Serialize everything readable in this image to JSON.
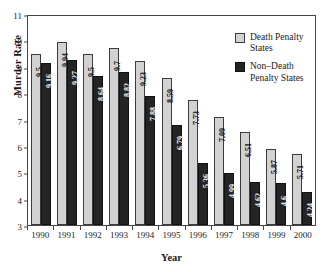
{
  "chart_data": {
    "type": "bar",
    "title": "",
    "xlabel": "Year",
    "ylabel": "Murder Rate",
    "categories": [
      "1990",
      "1991",
      "1992",
      "1993",
      "1994",
      "1995",
      "1996",
      "1997",
      "1998",
      "1999",
      "2000"
    ],
    "series": [
      {
        "name": "Death Penalty States",
        "color": "#d2d2d2",
        "values": [
          9.5,
          9.94,
          9.5,
          9.7,
          9.23,
          8.59,
          7.73,
          7.09,
          6.51,
          5.87,
          5.71
        ],
        "labels": [
          "9.5",
          "9.94",
          "9.5",
          "9.7",
          "9.23",
          "8.59",
          "7.73",
          "7.09",
          "6.51",
          "5.87",
          "5.71"
        ]
      },
      {
        "name": "Non-Death Penalty States",
        "color": "#242424",
        "values": [
          9.16,
          9.27,
          8.64,
          8.82,
          7.88,
          6.79,
          5.36,
          4.99,
          4.62,
          4.6,
          4.24
        ],
        "labels": [
          "9.16",
          "9.27",
          "8.64",
          "8.82",
          "7.88",
          "6.79",
          "5.36",
          "4.99",
          "4.62",
          "4.6",
          "4.24"
        ]
      }
    ],
    "ylim": [
      3,
      11
    ],
    "yticks": [
      "3",
      "4",
      "5",
      "6",
      "7",
      "8",
      "9",
      "10",
      "11"
    ],
    "grid": false,
    "legend_position": "top-right"
  },
  "legend": {
    "entries": [
      {
        "label": "Death Penalty\nStates",
        "swatch": "dp"
      },
      {
        "label": "Non–Death\nPenalty States",
        "swatch": "ndp"
      }
    ]
  }
}
